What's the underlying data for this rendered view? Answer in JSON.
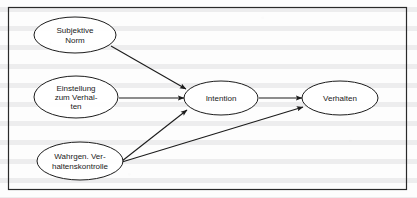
{
  "figure": {
    "frame": {
      "visible": true,
      "color": "#2a2a2a"
    },
    "background_color": "#fdfdfd",
    "stroke_color": "#1c1c1c"
  },
  "chart_data": {
    "type": "diagram",
    "nodes": [
      {
        "id": "subjektive-norm",
        "label_lines": [
          "Subjektive",
          "Norm"
        ],
        "label": "Subjektive Norm",
        "shape": "ellipse",
        "cx": 75,
        "cy": 35,
        "rx": 41,
        "ry": 18
      },
      {
        "id": "einstellung-zum-verhalten",
        "label_lines": [
          "Einstellung",
          "zum Verhal-",
          "ten"
        ],
        "label": "Einstellung zum Verhalten",
        "shape": "ellipse",
        "cx": 76,
        "cy": 97,
        "rx": 42,
        "ry": 21
      },
      {
        "id": "wahrgenommene-verhaltenskontrolle",
        "label_lines": [
          "Wahrgen. Ver-",
          "haltenskontrolle"
        ],
        "label": "Wahrgenommene Verhaltenskontrolle",
        "shape": "ellipse",
        "cx": 80,
        "cy": 161,
        "rx": 43,
        "ry": 19
      },
      {
        "id": "intention",
        "label_lines": [
          "Intention"
        ],
        "label": "Intention",
        "shape": "ellipse",
        "cx": 221,
        "cy": 98,
        "rx": 37,
        "ry": 17
      },
      {
        "id": "verhalten",
        "label_lines": [
          "Verhalten"
        ],
        "label": "Verhalten",
        "shape": "ellipse",
        "cx": 340,
        "cy": 98,
        "rx": 38,
        "ry": 17
      }
    ],
    "edges": [
      {
        "id": "edge-norm-intention",
        "from": "subjektive-norm",
        "to": "intention",
        "x1": 111,
        "y1": 46,
        "x2": 186,
        "y2": 89,
        "arrow": "end"
      },
      {
        "id": "edge-einstellung-intention",
        "from": "einstellung-zum-verhalten",
        "to": "intention",
        "x1": 119,
        "y1": 98,
        "x2": 184,
        "y2": 98,
        "arrow": "end"
      },
      {
        "id": "edge-kontrolle-intention",
        "from": "wahrgenommene-verhaltenskontrolle",
        "to": "intention",
        "x1": 122,
        "y1": 161,
        "x2": 187,
        "y2": 110,
        "arrow": "end"
      },
      {
        "id": "edge-intention-verhalten",
        "from": "intention",
        "to": "verhalten",
        "x1": 259,
        "y1": 98,
        "x2": 302,
        "y2": 98,
        "arrow": "end"
      },
      {
        "id": "edge-kontrolle-verhalten",
        "from": "wahrgenommene-verhaltenskontrolle",
        "to": "verhalten",
        "x1": 122,
        "y1": 162,
        "x2": 303,
        "y2": 107,
        "arrow": "end"
      }
    ],
    "layout": {
      "width": 417,
      "height": 198,
      "frame": {
        "x": 8,
        "y": 7,
        "width": 398,
        "height": 182
      }
    }
  }
}
